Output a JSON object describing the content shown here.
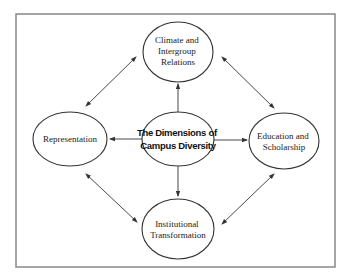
{
  "diagram": {
    "center": {
      "id": "center",
      "lines": [
        "The Dimensions of",
        "Campus Diversity"
      ]
    },
    "nodes": [
      {
        "id": "climate",
        "lines": [
          "Climate and",
          "Intergroup",
          "Relations"
        ]
      },
      {
        "id": "representation",
        "lines": [
          "Representation"
        ]
      },
      {
        "id": "education",
        "lines": [
          "Education and",
          "Scholarship"
        ]
      },
      {
        "id": "institutional",
        "lines": [
          "Institutional",
          "Transformation"
        ]
      }
    ],
    "edges": [
      {
        "from": "center",
        "to": "climate",
        "type": "one-way"
      },
      {
        "from": "center",
        "to": "representation",
        "type": "one-way"
      },
      {
        "from": "center",
        "to": "education",
        "type": "one-way"
      },
      {
        "from": "center",
        "to": "institutional",
        "type": "one-way"
      },
      {
        "from": "climate",
        "to": "representation",
        "type": "two-way"
      },
      {
        "from": "climate",
        "to": "education",
        "type": "two-way"
      },
      {
        "from": "representation",
        "to": "institutional",
        "type": "two-way"
      },
      {
        "from": "education",
        "to": "institutional",
        "type": "two-way"
      }
    ]
  }
}
